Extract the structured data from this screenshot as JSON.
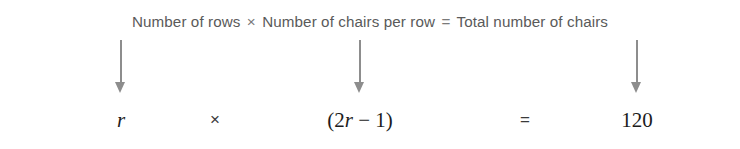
{
  "figure": {
    "background_color": "#ffffff",
    "width": 740,
    "height": 149
  },
  "word_equation": {
    "factor_1": "Number of rows",
    "operator_multiply": "×",
    "factor_2": "Number of chairs per row",
    "operator_equals": "=",
    "result": "Total number of chairs",
    "text_color": "#5a5a5a"
  },
  "arrows": [
    {
      "name": "arrow-to-rows-variable",
      "x": 121,
      "direction": "down",
      "color": "#8d8d8d"
    },
    {
      "name": "arrow-to-chairs-expression",
      "x": 360,
      "direction": "down",
      "color": "#8d8d8d"
    },
    {
      "name": "arrow-to-total-value",
      "x": 637,
      "direction": "down",
      "color": "#8d8d8d"
    }
  ],
  "symbolic_equation": {
    "terms": [
      {
        "name": "rows-variable",
        "x": 121,
        "prefix": "",
        "variable": "r",
        "suffix": ""
      },
      {
        "name": "multiply-operator",
        "x": 215,
        "text": "×"
      },
      {
        "name": "chairs-expression",
        "x": 360,
        "prefix": "(2",
        "variable": "r",
        "suffix": " − 1)"
      },
      {
        "name": "equals-operator",
        "x": 525,
        "text": "="
      },
      {
        "name": "total-value",
        "x": 637,
        "text": "120"
      }
    ],
    "text_color": "#1c1c1c"
  }
}
